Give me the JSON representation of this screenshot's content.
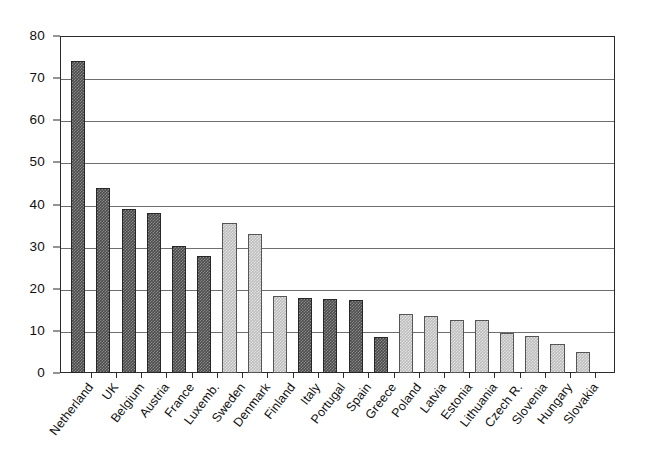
{
  "chart_data": {
    "type": "bar",
    "title": "",
    "subtitle": "",
    "xlabel": "",
    "ylabel": "",
    "ylim": [
      0,
      80
    ],
    "yticks": [
      0,
      10,
      20,
      30,
      40,
      50,
      60,
      70,
      80
    ],
    "grid": true,
    "legend": "none",
    "categories": [
      "Netherland",
      "UK",
      "Belgium",
      "Austria",
      "France",
      "Luxemb.",
      "Sweden",
      "Denmark",
      "Finland",
      "Italy",
      "Portugal",
      "Spain",
      "Greece",
      "Poland",
      "Latvia",
      "Estonia",
      "Lithuania",
      "Czech R.",
      "Slovenia",
      "Hungary",
      "Slovakia"
    ],
    "values": [
      74.0,
      44.0,
      39.0,
      38.0,
      30.2,
      27.8,
      35.7,
      33.0,
      18.3,
      17.7,
      17.5,
      17.3,
      8.5,
      14.0,
      13.5,
      12.7,
      12.6,
      9.5,
      8.8,
      7.0,
      5.0
    ],
    "bar_styles": [
      "dark",
      "dark",
      "dark",
      "dark",
      "dark",
      "dark",
      "light",
      "light",
      "light",
      "dark",
      "dark",
      "dark",
      "dark",
      "light",
      "light",
      "light",
      "light",
      "light",
      "light",
      "light",
      "light"
    ],
    "colors": {
      "dark_bar": "#4c4c4c",
      "light_bar": "#bdbdbd",
      "bar_outline": "#3b3b3b",
      "gridline": "#6e6e6e",
      "axis": "#2b2b2b",
      "background": "#ffffff",
      "text": "#101010"
    }
  }
}
